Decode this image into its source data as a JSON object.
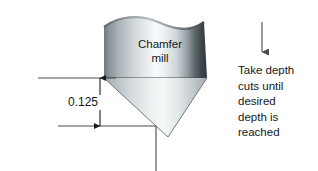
{
  "figure": {
    "background_color": "#ffffff",
    "line_color": "#4a4a4a",
    "text_color": "#15181b"
  },
  "tool": {
    "label_line_1": "Chamfer",
    "label_line_2": "mill",
    "body_edge_dark": "#555f66",
    "body_highlight": "#fafbfb",
    "body_right_dark": "#3c4449",
    "cone_light": "#eef1f2",
    "cone_dark": "#8e999e"
  },
  "dimension": {
    "value": "0.125",
    "arrow_color": "#1a1a1a"
  },
  "note": {
    "line_1": "Take depth",
    "line_2": "cuts until",
    "line_3": "desired",
    "line_4": "depth is",
    "line_5": "reached",
    "arrow_color": "#4a4a4a"
  }
}
